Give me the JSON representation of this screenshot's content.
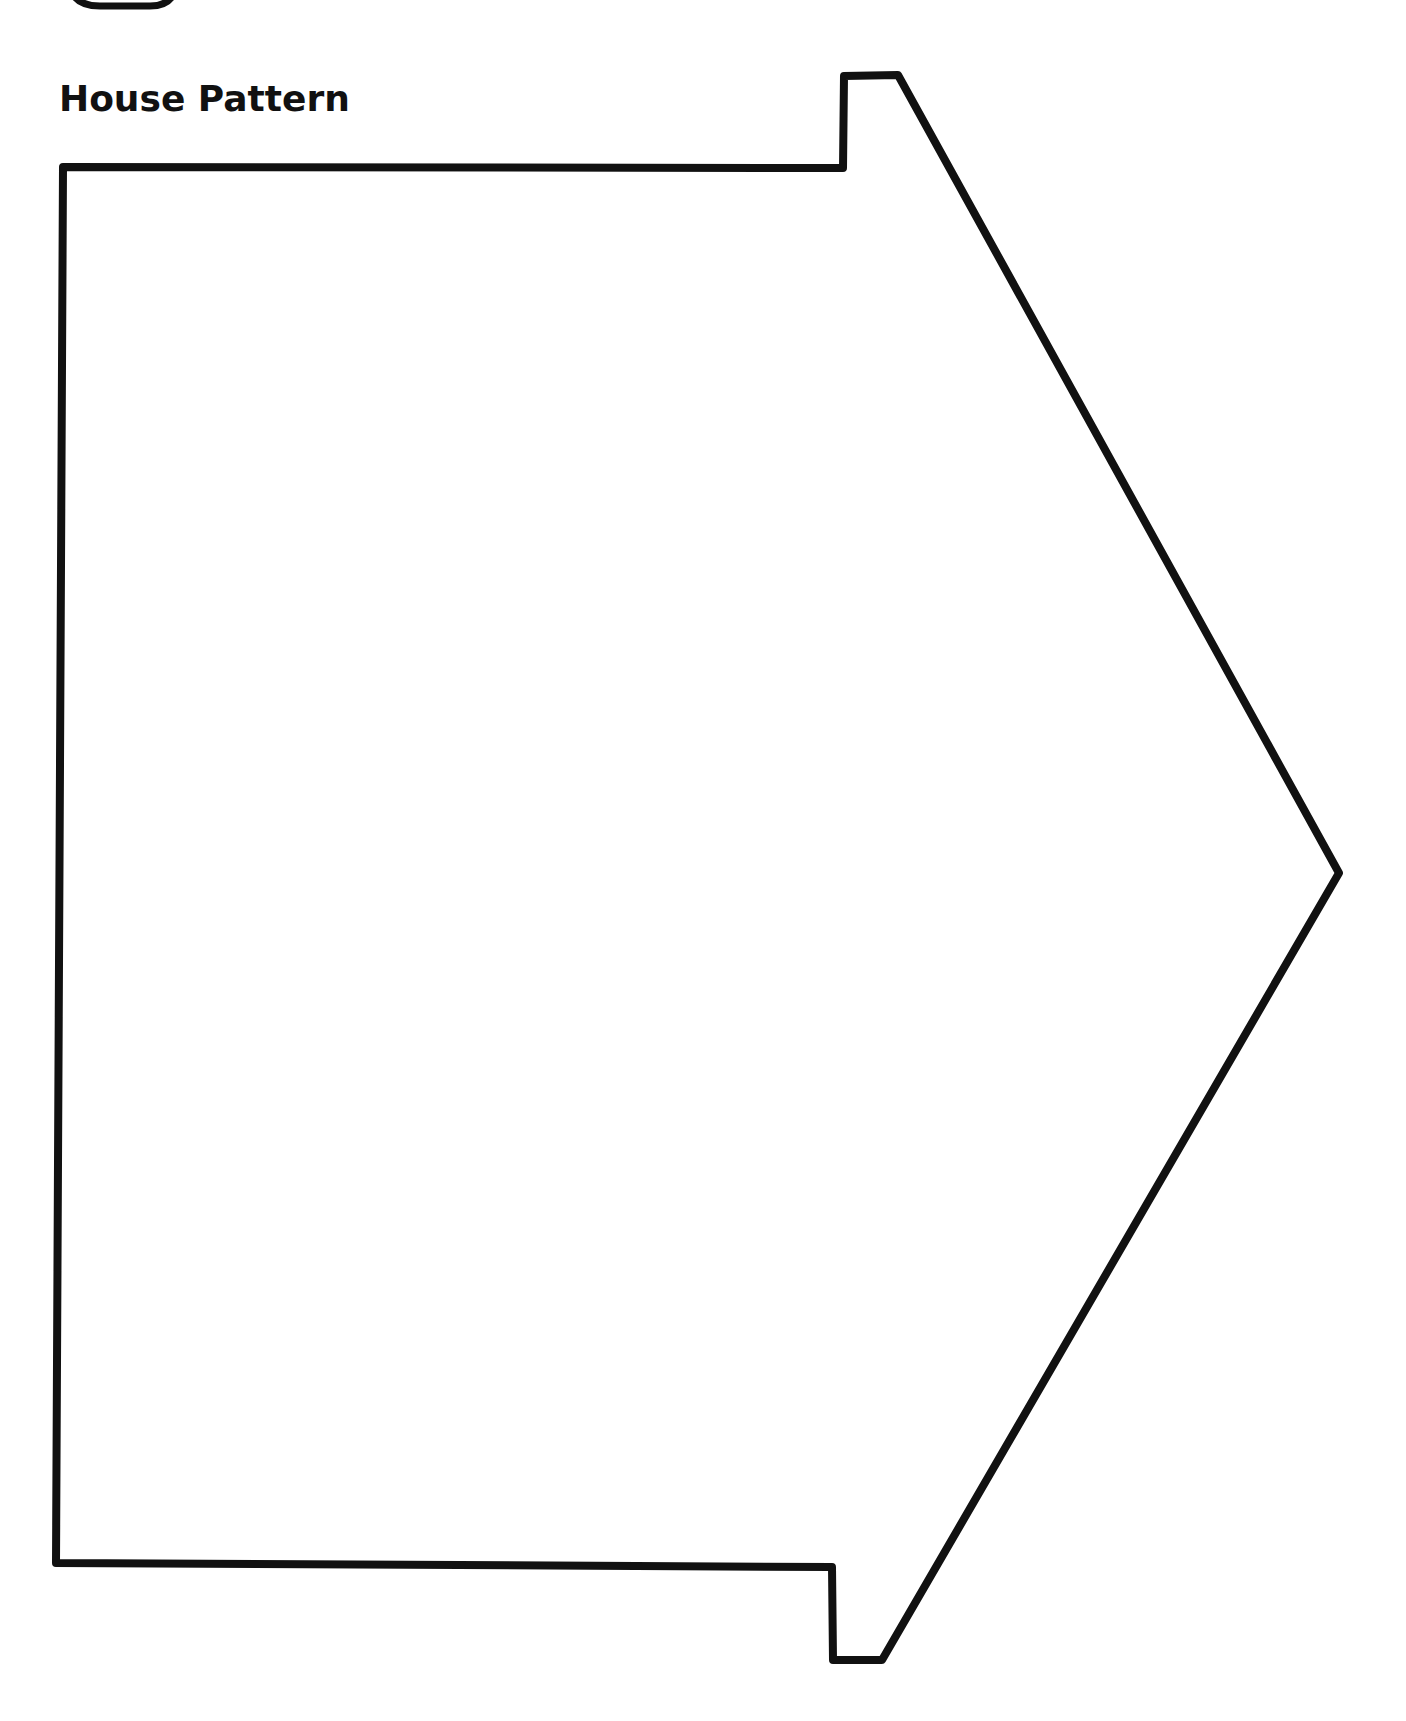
{
  "page": {
    "title": "House Pattern"
  },
  "pattern": {
    "shape": "house-outline",
    "stroke_color": "#111111",
    "stroke_width": 8
  }
}
